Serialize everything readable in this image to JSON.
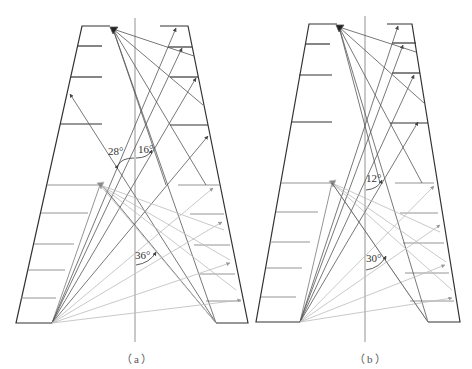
{
  "figure": {
    "panels": [
      {
        "id": "a",
        "caption": "（a）",
        "angles": [
          {
            "label": "28°",
            "x": 108,
            "y": 155
          },
          {
            "label": "16°",
            "x": 138,
            "y": 153
          },
          {
            "label": "36°",
            "x": 135,
            "y": 259
          }
        ]
      },
      {
        "id": "b",
        "caption": "（b）",
        "angles": [
          {
            "label": "12°",
            "x": 366,
            "y": 182
          },
          {
            "label": "30°",
            "x": 366,
            "y": 261
          }
        ]
      }
    ],
    "colors": {
      "structure": "#333333",
      "ray_dark": "#555555",
      "ray_light": "#bbbbbb",
      "axis": "#666666"
    }
  }
}
